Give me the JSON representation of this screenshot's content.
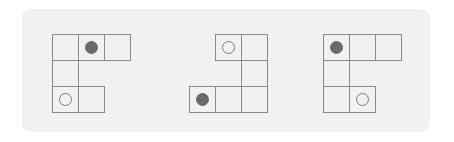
{
  "panel": {
    "background": "#f1f1f1"
  },
  "style": {
    "line_color": "#8a8a8a",
    "filled_color": "#6a6a6a",
    "hollow_color": "#7a7a7a",
    "cell_size": 26,
    "dot_size": 13
  },
  "figures": [
    {
      "label": "figure-1",
      "origin": [
        52,
        34
      ],
      "cells": [
        [
          0,
          0
        ],
        [
          1,
          0
        ],
        [
          2,
          0
        ],
        [
          0,
          1
        ],
        [
          0,
          2
        ],
        [
          1,
          2
        ]
      ],
      "dots": [
        {
          "type": "filled",
          "cell": [
            1,
            0
          ]
        },
        {
          "type": "hollow",
          "cell": [
            0,
            2
          ]
        }
      ]
    },
    {
      "label": "figure-2",
      "origin": [
        189,
        34
      ],
      "cells": [
        [
          1,
          0
        ],
        [
          2,
          0
        ],
        [
          2,
          1
        ],
        [
          0,
          2
        ],
        [
          1,
          2
        ],
        [
          2,
          2
        ]
      ],
      "dots": [
        {
          "type": "hollow",
          "cell": [
            1,
            0
          ]
        },
        {
          "type": "filled",
          "cell": [
            0,
            2
          ]
        }
      ]
    },
    {
      "label": "figure-3",
      "origin": [
        323,
        34
      ],
      "cells": [
        [
          0,
          0
        ],
        [
          1,
          0
        ],
        [
          2,
          0
        ],
        [
          0,
          1
        ],
        [
          0,
          2
        ],
        [
          1,
          2
        ]
      ],
      "dots": [
        {
          "type": "filled",
          "cell": [
            0,
            0
          ]
        },
        {
          "type": "hollow",
          "cell": [
            1,
            2
          ]
        }
      ]
    }
  ]
}
